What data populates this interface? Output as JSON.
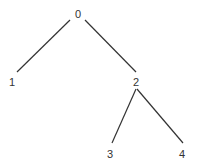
{
  "tree": {
    "nodes": [
      {
        "id": "0",
        "label": "0"
      },
      {
        "id": "1",
        "label": "1"
      },
      {
        "id": "2",
        "label": "2"
      },
      {
        "id": "3",
        "label": "3"
      },
      {
        "id": "4",
        "label": "4"
      }
    ],
    "edges": [
      {
        "from": "0",
        "to": "1"
      },
      {
        "from": "0",
        "to": "2"
      },
      {
        "from": "2",
        "to": "3"
      },
      {
        "from": "2",
        "to": "4"
      }
    ],
    "colors": {
      "line": "#333333",
      "text": "#333333",
      "background": "#ffffff"
    }
  }
}
